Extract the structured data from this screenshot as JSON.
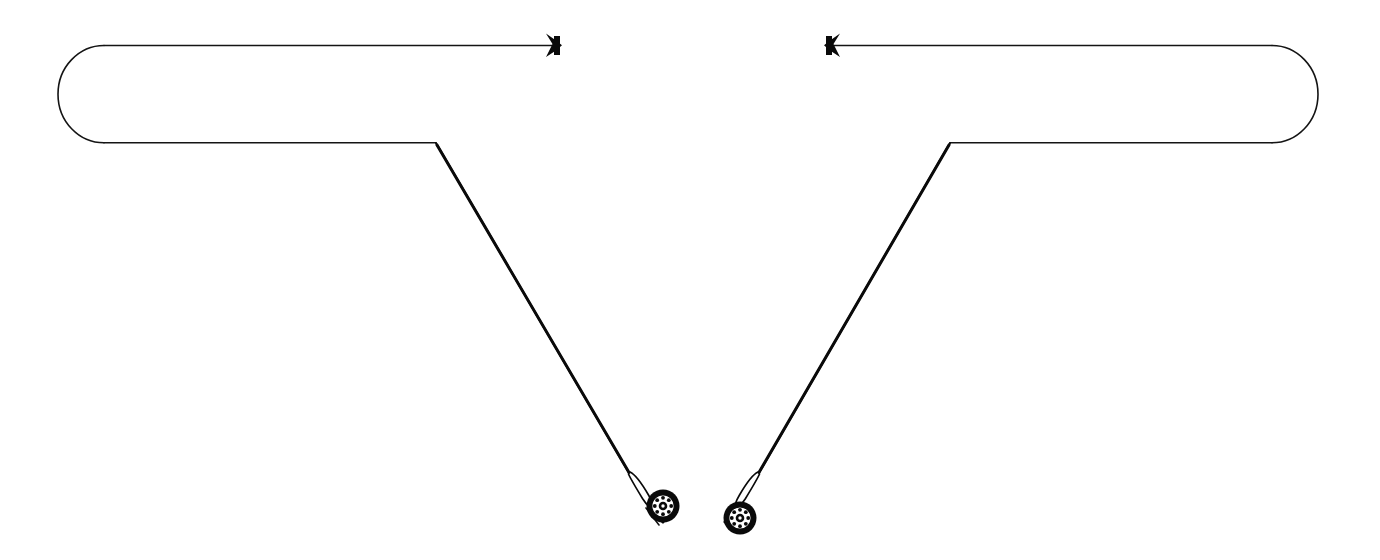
{
  "figure": {
    "background_color": "#ffffff",
    "ink_color": "#0a0a0a",
    "width": 1380,
    "height": 560,
    "style": "monochrome line art"
  },
  "elements": {
    "left_loop": {
      "name": "left-line-loop",
      "description": "rounded open-ended line loop, left side",
      "cap_x": 57,
      "top_y": 45,
      "bottom_y": 143,
      "corner_x": 436
    },
    "right_loop": {
      "name": "right-line-loop",
      "description": "rounded open-ended line loop, right side",
      "cap_x": 1318,
      "top_y": 45,
      "bottom_y": 143,
      "corner_x": 950
    },
    "left_arrow": {
      "name": "left-arrow-marker",
      "direction": "right",
      "tip_x": 560,
      "y": 45
    },
    "right_arrow": {
      "name": "right-arrow-marker",
      "direction": "left",
      "tip_x": 828,
      "y": 45
    },
    "left_rod": {
      "name": "left-fishing-rod",
      "tip_x": 436,
      "tip_y": 143,
      "butt_x": 648,
      "butt_y": 514,
      "reel_cx": 662,
      "reel_cy": 507,
      "reel_r": 16
    },
    "right_rod": {
      "name": "right-fishing-rod",
      "tip_x": 950,
      "tip_y": 143,
      "butt_x": 733,
      "butt_y": 514,
      "reel_cx": 740,
      "reel_cy": 518,
      "reel_r": 16
    }
  },
  "labels": {
    "caption": "",
    "annotations": []
  }
}
